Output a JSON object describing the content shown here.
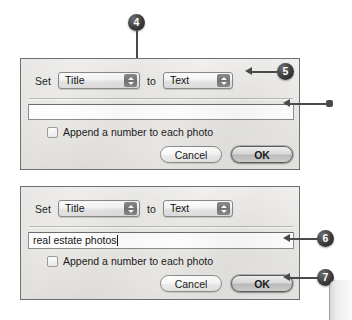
{
  "page": {
    "background_color": "#ffffff",
    "accent_color": "#3c3c3c",
    "dialog_border_color": "#6f6f6f"
  },
  "dialogs": [
    {
      "id": "rename-dialog-empty",
      "row": {
        "set_label": "Set",
        "attribute_select": {
          "value": "Title",
          "options": [
            "Title",
            "Caption",
            "Keywords",
            "Copyright"
          ]
        },
        "to_label": "to",
        "source_select": {
          "value": "Text",
          "options": [
            "Text",
            "Filename",
            "Date",
            "Metadata"
          ]
        }
      },
      "text_input": {
        "value": "",
        "placeholder": ""
      },
      "checkbox": {
        "label": "Append a number to each photo",
        "checked": false
      },
      "buttons": {
        "cancel_label": "Cancel",
        "ok_label": "OK"
      }
    },
    {
      "id": "rename-dialog-filled",
      "row": {
        "set_label": "Set",
        "attribute_select": {
          "value": "Title",
          "options": [
            "Title",
            "Caption",
            "Keywords",
            "Copyright"
          ]
        },
        "to_label": "to",
        "source_select": {
          "value": "Text",
          "options": [
            "Text",
            "Filename",
            "Date",
            "Metadata"
          ]
        }
      },
      "text_input": {
        "value": "real estate photos",
        "placeholder": ""
      },
      "checkbox": {
        "label": "Append a number to each photo",
        "checked": false
      },
      "buttons": {
        "cancel_label": "Cancel",
        "ok_label": "OK"
      }
    }
  ],
  "callouts": [
    {
      "number": "4",
      "target": "attribute-popup-dialog-1"
    },
    {
      "number": "5",
      "target": "source-popup-dialog-1"
    },
    {
      "number": "6",
      "target": "text-input-dialog-2"
    },
    {
      "number": "7",
      "target": "ok-button-dialog-2"
    }
  ]
}
